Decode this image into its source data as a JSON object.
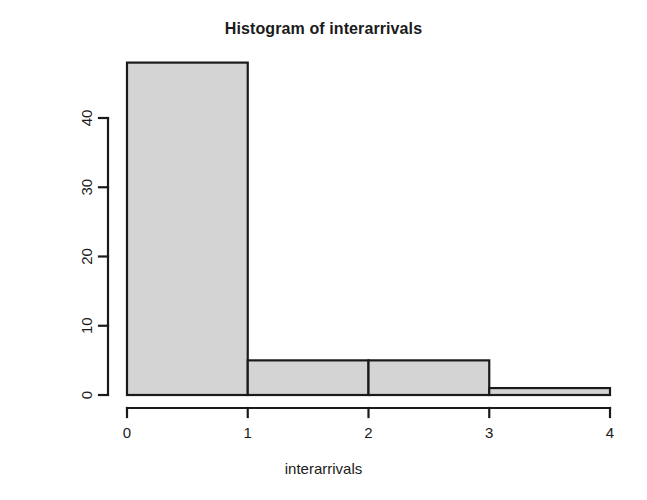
{
  "chart_data": {
    "type": "bar",
    "title": "Histogram of interarrivals",
    "xlabel": "interarrivals",
    "ylabel": "Frequency",
    "categories": [
      "0-1",
      "1-2",
      "2-3",
      "3-4"
    ],
    "bin_edges": [
      0,
      1,
      2,
      3,
      4
    ],
    "values": [
      48,
      5,
      5,
      1
    ],
    "xlim": [
      0,
      4
    ],
    "ylim": [
      0,
      48
    ],
    "x_ticks": [
      0,
      1,
      2,
      3,
      4
    ],
    "x_tick_labels": [
      "0",
      "1",
      "2",
      "3",
      "4"
    ],
    "y_ticks": [
      0,
      10,
      20,
      30,
      40
    ],
    "y_tick_labels": [
      "0",
      "10",
      "20",
      "30",
      "40"
    ],
    "grid": false,
    "legend": false,
    "bar_fill_color": "#d4d4d4",
    "bar_border_color": "#1a1a1a",
    "axis_color": "#1a1a1a",
    "background_color": "#ffffff"
  },
  "axes": {
    "x_tick_labels": [
      "0",
      "1",
      "2",
      "3",
      "4"
    ],
    "y_tick_labels": [
      "0",
      "10",
      "20",
      "30",
      "40"
    ]
  },
  "bars": [
    {
      "label": "0-1",
      "value": 48
    },
    {
      "label": "1-2",
      "value": 5
    },
    {
      "label": "2-3",
      "value": 5
    },
    {
      "label": "3-4",
      "value": 1
    }
  ]
}
